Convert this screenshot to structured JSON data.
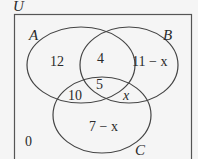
{
  "diagram": {
    "type": "venn",
    "universe_label": "U",
    "sets": [
      {
        "name": "A"
      },
      {
        "name": "B"
      },
      {
        "name": "C"
      }
    ],
    "regions": {
      "only_A": "12",
      "A_and_B_only": "4",
      "only_B": "11 − x",
      "A_B_C": "5",
      "A_and_C_only": "10",
      "B_and_C_only": "x",
      "only_C": "7 − x",
      "outside": "0"
    },
    "colors": {
      "background": "#f5f5f5",
      "stroke": "#444444",
      "text": "#2a2a2a"
    }
  }
}
